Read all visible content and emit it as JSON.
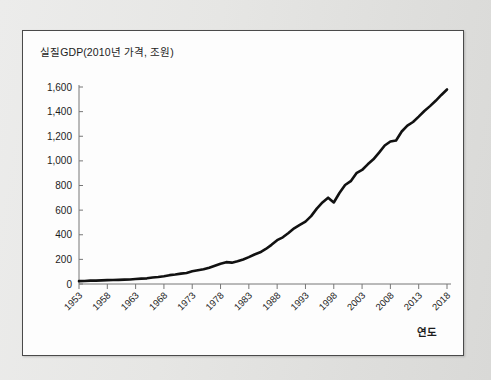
{
  "figure": {
    "axis_title_y": "실질GDP(2010년 가격, 조원)",
    "axis_title_x": "연도",
    "line_color": "#111111",
    "axis_color": "#777777",
    "panel_background": "#fdfdfd",
    "page_background": "#e9e9e7"
  },
  "chart_data": {
    "type": "line",
    "title": "실질GDP(2010년 가격, 조원)",
    "xlabel": "연도",
    "ylabel": "실질GDP(2010년 가격, 조원)",
    "xlim": [
      1953,
      2018
    ],
    "ylim": [
      0,
      1600
    ],
    "grid": false,
    "legend": "none",
    "y_ticks": [
      0,
      200,
      400,
      600,
      800,
      1000,
      1200,
      1400,
      1600
    ],
    "y_tick_labels": [
      "0",
      "200",
      "400",
      "600",
      "800",
      "1,000",
      "1,200",
      "1,400",
      "1,600"
    ],
    "x_ticks": [
      1953,
      1958,
      1963,
      1968,
      1973,
      1978,
      1983,
      1988,
      1993,
      1998,
      2003,
      2008,
      2013,
      2018
    ],
    "x_tick_labels": [
      "1953",
      "1958",
      "1963",
      "1968",
      "1973",
      "1978",
      "1983",
      "1988",
      "1993",
      "1998",
      "2003",
      "2008",
      "2013",
      "2018"
    ],
    "series": [
      {
        "name": "실질GDP",
        "x": [
          1953,
          1954,
          1955,
          1956,
          1957,
          1958,
          1959,
          1960,
          1961,
          1962,
          1963,
          1964,
          1965,
          1966,
          1967,
          1968,
          1969,
          1970,
          1971,
          1972,
          1973,
          1974,
          1975,
          1976,
          1977,
          1978,
          1979,
          1980,
          1981,
          1982,
          1983,
          1984,
          1985,
          1986,
          1987,
          1988,
          1989,
          1990,
          1991,
          1992,
          1993,
          1994,
          1995,
          1996,
          1997,
          1998,
          1999,
          2000,
          2001,
          2002,
          2003,
          2004,
          2005,
          2006,
          2007,
          2008,
          2009,
          2010,
          2011,
          2012,
          2013,
          2014,
          2015,
          2016,
          2017,
          2018
        ],
        "values": [
          17,
          18,
          20,
          20,
          22,
          23,
          24,
          25,
          26,
          27,
          30,
          32,
          34,
          39,
          42,
          47,
          53,
          57,
          62,
          66,
          76,
          82,
          88,
          98,
          110,
          122,
          131,
          128,
          136,
          147,
          161,
          177,
          190,
          210,
          235,
          263,
          280,
          306,
          334,
          354,
          374,
          407,
          452,
          489,
          518,
          489,
          546,
          594,
          617,
          665,
          684,
          718,
          748,
          788,
          831,
          855,
          861,
          915,
          950,
          972,
          1004,
          1038,
          1067,
          1099,
          1134,
          1167
        ],
        "color": "#111111",
        "line_width": 2.6,
        "annotations": [
          {
            "year": 1998,
            "note": "아시아 외환위기 급락"
          },
          {
            "year": 2009,
            "note": "글로벌 금융위기 정체"
          }
        ]
      }
    ],
    "scaled_note": "Curve plotted from series values scaled so 2018 reaches ~1,580 on the 0–1,600 axis."
  }
}
